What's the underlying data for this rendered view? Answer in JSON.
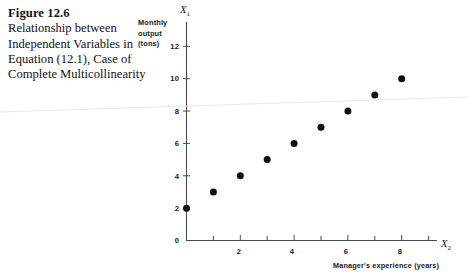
{
  "caption": {
    "figure_number": "Figure 12.6",
    "text": "Relationship between Independent Variables in Equation (12.1), Case of Complete Multicollinearity"
  },
  "chart_data": {
    "type": "scatter",
    "title": "",
    "xlabel": "Manager's experience (years)",
    "ylabel": "Monthly output (tons)",
    "x_axis_symbol": "X",
    "x_axis_subscript": "2",
    "y_axis_symbol": "X",
    "y_axis_subscript": "1",
    "xlim": [
      0,
      9.6
    ],
    "ylim": [
      0,
      13.1
    ],
    "xticks_major": [
      0,
      2,
      4,
      6,
      8
    ],
    "xticks_minor": [
      1,
      3,
      5,
      7,
      9
    ],
    "yticks_major": [
      0,
      2,
      4,
      6,
      8,
      10,
      12
    ],
    "grid": false,
    "legend": false,
    "marker": "filled-circle",
    "marker_color": "#101010",
    "relationship": "X1 = X2 + 2",
    "x": [
      0,
      1,
      2,
      3,
      4,
      5,
      6,
      7,
      8
    ],
    "values": [
      2,
      3,
      4,
      5,
      6,
      7,
      8,
      9,
      10
    ],
    "points": [
      {
        "x": 0,
        "y": 2
      },
      {
        "x": 1,
        "y": 3
      },
      {
        "x": 2,
        "y": 4
      },
      {
        "x": 3,
        "y": 5
      },
      {
        "x": 4,
        "y": 6
      },
      {
        "x": 5,
        "y": 7
      },
      {
        "x": 6,
        "y": 8
      },
      {
        "x": 7,
        "y": 9
      },
      {
        "x": 8,
        "y": 10
      }
    ]
  },
  "labels": {
    "y_line1": "Monthly",
    "y_line2": "output",
    "y_line3": "(tons)",
    "x_caption": "Manager's experience (years)",
    "y0": "0",
    "y2": "2",
    "y4": "4",
    "y6": "6",
    "y8": "8",
    "y10": "10",
    "y12": "12",
    "x2": "2",
    "x4": "4",
    "x6": "6",
    "x8": "8"
  },
  "colors": {
    "ink": "#1a1a1a",
    "axis": "#4a4a4a",
    "marker": "#101010",
    "page": "#ffffff"
  }
}
